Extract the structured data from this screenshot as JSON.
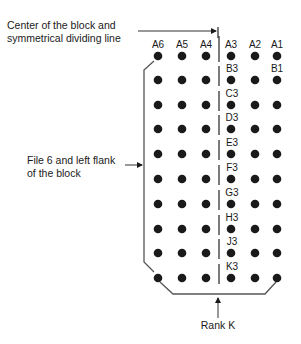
{
  "annotations": {
    "center_line": [
      "Center of the block and",
      "symmetrical dividing line"
    ],
    "left_flank": [
      "File 6 and left flank",
      "of the block"
    ],
    "rank": "Rank K"
  },
  "columns": [
    {
      "file": "6",
      "x": 158
    },
    {
      "file": "5",
      "x": 182
    },
    {
      "file": "4",
      "x": 206
    },
    {
      "file": "3",
      "x": 231
    },
    {
      "file": "2",
      "x": 255
    },
    {
      "file": "1",
      "x": 277
    }
  ],
  "rows": [
    {
      "rank": "A",
      "y": 56
    },
    {
      "rank": "B",
      "y": 80
    },
    {
      "rank": "C",
      "y": 105
    },
    {
      "rank": "D",
      "y": 129
    },
    {
      "rank": "E",
      "y": 154
    },
    {
      "rank": "F",
      "y": 179
    },
    {
      "rank": "G",
      "y": 204
    },
    {
      "rank": "H",
      "y": 229
    },
    {
      "rank": "J",
      "y": 253
    },
    {
      "rank": "K",
      "y": 278
    }
  ],
  "top_labels": [
    "A6",
    "A5",
    "A4",
    "A3",
    "A2",
    "A1"
  ],
  "b1_label": "B1",
  "col3_labels": [
    "B3",
    "C3",
    "D3",
    "E3",
    "F3",
    "G3",
    "H3",
    "J3",
    "K3"
  ],
  "colors": {
    "ink": "#1a1a1a",
    "line": "#444444"
  }
}
